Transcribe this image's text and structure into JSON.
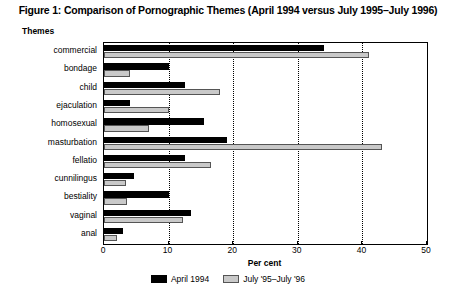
{
  "chart_data": {
    "type": "bar",
    "orientation": "horizontal",
    "title": "Figure 1: Comparison of Pornographic Themes (April 1994 versus July 1995–July 1996)",
    "xlabel": "Per cent",
    "ylabel": "Themes",
    "xlim": [
      0,
      50
    ],
    "xticks": [
      0,
      10,
      20,
      30,
      40,
      50
    ],
    "grid": "vertical-dotted",
    "legend_position": "bottom-center",
    "categories": [
      "commercial",
      "bondage",
      "child",
      "ejaculation",
      "homosexual",
      "masturbation",
      "fellatio",
      "cunnilingus",
      "bestiality",
      "vaginal",
      "anal"
    ],
    "series": [
      {
        "name": "April 1994",
        "color": "#000000",
        "values": [
          34,
          10,
          12.5,
          4,
          15.5,
          19,
          12.5,
          4.6,
          10,
          13.5,
          3
        ]
      },
      {
        "name": "July '95–July '96",
        "color": "#c9c9c9",
        "values": [
          41,
          4,
          18,
          10,
          7,
          43,
          16.5,
          3.4,
          3.6,
          12.2,
          2
        ]
      }
    ]
  },
  "legend": {
    "items": [
      {
        "label": "April 1994"
      },
      {
        "label": "July '95–July '96"
      }
    ]
  }
}
